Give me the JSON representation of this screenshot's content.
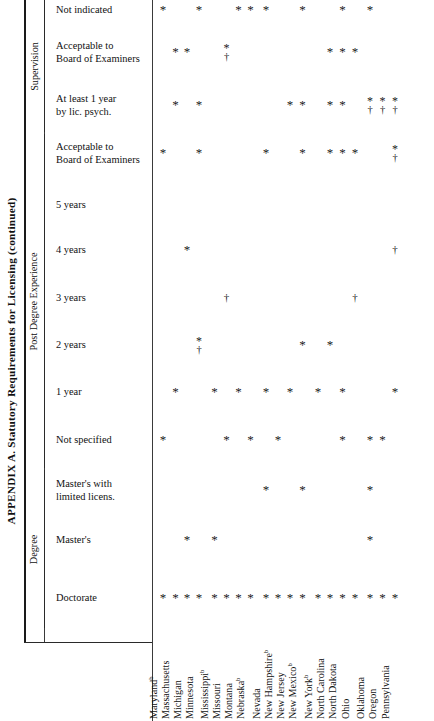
{
  "caption": "APPENDIX A.   Statutory Requirements for Licensing (continued)",
  "groups": [
    {
      "id": "supervision",
      "label": "Supervision"
    },
    {
      "id": "post-degree",
      "label": "Post Degree Experience"
    },
    {
      "id": "degree",
      "label": "Degree"
    }
  ],
  "rows": [
    {
      "id": "not-indicated",
      "group": "supervision",
      "line1": "Not indicated",
      "line2": ""
    },
    {
      "id": "sup-acceptable",
      "group": "supervision",
      "line1": "Acceptable to",
      "line2": "Board of Examiners"
    },
    {
      "id": "at-least-1-year",
      "group": "supervision",
      "line1": "At least 1 year",
      "line2": "by lic. psych."
    },
    {
      "id": "pde-acceptable",
      "group": "post-degree",
      "line1": "Acceptable to",
      "line2": "Board of Examiners"
    },
    {
      "id": "five-years",
      "group": "post-degree",
      "line1": "5 years",
      "line2": ""
    },
    {
      "id": "four-years",
      "group": "post-degree",
      "line1": "4 years",
      "line2": ""
    },
    {
      "id": "three-years",
      "group": "post-degree",
      "line1": "3 years",
      "line2": ""
    },
    {
      "id": "two-years",
      "group": "post-degree",
      "line1": "2 years",
      "line2": ""
    },
    {
      "id": "one-year",
      "group": "post-degree",
      "line1": "1 year",
      "line2": ""
    },
    {
      "id": "not-specified",
      "group": "post-degree",
      "line1": "Not specified",
      "line2": ""
    },
    {
      "id": "masters-limited",
      "group": "degree",
      "line1": "Master's with",
      "line2": "limited licens."
    },
    {
      "id": "masters",
      "group": "degree",
      "line1": "Master's",
      "line2": ""
    },
    {
      "id": "doctorate",
      "group": "degree",
      "line1": "Doctorate",
      "line2": ""
    }
  ],
  "states": [
    {
      "id": "maryland",
      "name": "Maryland",
      "note": "b"
    },
    {
      "id": "massachusetts",
      "name": "Massachusetts",
      "note": ""
    },
    {
      "id": "michigan",
      "name": "Michigan",
      "note": ""
    },
    {
      "id": "minnesota",
      "name": "Minnesota",
      "note": ""
    },
    {
      "id": "mississippi",
      "name": "Mississippi",
      "note": "b"
    },
    {
      "id": "missouri",
      "name": "Missouri",
      "note": ""
    },
    {
      "id": "montana",
      "name": "Montana",
      "note": ""
    },
    {
      "id": "nebraska",
      "name": "Nebraska",
      "note": "b"
    },
    {
      "id": "nevada",
      "name": "Nevada",
      "note": ""
    },
    {
      "id": "new-hampshire",
      "name": "New Hampshire",
      "note": "b"
    },
    {
      "id": "new-jersey",
      "name": "New Jersey",
      "note": ""
    },
    {
      "id": "new-mexico",
      "name": "New Mexico",
      "note": "b"
    },
    {
      "id": "new-york",
      "name": "New York",
      "note": "b"
    },
    {
      "id": "north-carolina",
      "name": "North Carolina",
      "note": ""
    },
    {
      "id": "north-dakota",
      "name": "North Dakota",
      "note": ""
    },
    {
      "id": "ohio",
      "name": "Ohio",
      "note": ""
    },
    {
      "id": "oklahoma",
      "name": "Oklahoma",
      "note": ""
    },
    {
      "id": "oregon",
      "name": "Oregon",
      "note": ""
    },
    {
      "id": "pennsylvania",
      "name": "Pennsylvania",
      "note": ""
    }
  ],
  "symbols": {
    "star": "*",
    "dagger": "†",
    "star_dagger": "*†"
  },
  "marks": [
    {
      "row": "not-indicated",
      "state": "maryland",
      "symbol": "star"
    },
    {
      "row": "not-indicated",
      "state": "minnesota",
      "symbol": "star"
    },
    {
      "row": "not-indicated",
      "state": "montana",
      "symbol": "star"
    },
    {
      "row": "not-indicated",
      "state": "nebraska",
      "symbol": "star"
    },
    {
      "row": "not-indicated",
      "state": "nevada",
      "symbol": "star"
    },
    {
      "row": "not-indicated",
      "state": "new-mexico",
      "symbol": "star"
    },
    {
      "row": "not-indicated",
      "state": "north-dakota",
      "symbol": "star"
    },
    {
      "row": "not-indicated",
      "state": "oklahoma",
      "symbol": "star"
    },
    {
      "row": "sup-acceptable",
      "state": "massachusetts",
      "symbol": "star"
    },
    {
      "row": "sup-acceptable",
      "state": "michigan",
      "symbol": "star"
    },
    {
      "row": "sup-acceptable",
      "state": "missouri",
      "symbol": "star_dagger"
    },
    {
      "row": "sup-acceptable",
      "state": "north-carolina",
      "symbol": "star"
    },
    {
      "row": "sup-acceptable",
      "state": "north-dakota",
      "symbol": "star"
    },
    {
      "row": "sup-acceptable",
      "state": "ohio",
      "symbol": "star"
    },
    {
      "row": "at-least-1-year",
      "state": "massachusetts",
      "symbol": "star"
    },
    {
      "row": "at-least-1-year",
      "state": "minnesota",
      "symbol": "star"
    },
    {
      "row": "at-least-1-year",
      "state": "new-jersey",
      "symbol": "star"
    },
    {
      "row": "at-least-1-year",
      "state": "new-mexico",
      "symbol": "star"
    },
    {
      "row": "at-least-1-year",
      "state": "north-carolina",
      "symbol": "star"
    },
    {
      "row": "at-least-1-year",
      "state": "north-dakota",
      "symbol": "star"
    },
    {
      "row": "at-least-1-year",
      "state": "oklahoma",
      "symbol": "star_dagger"
    },
    {
      "row": "at-least-1-year",
      "state": "oregon",
      "symbol": "star_dagger"
    },
    {
      "row": "at-least-1-year",
      "state": "pennsylvania",
      "symbol": "star_dagger"
    },
    {
      "row": "pde-acceptable",
      "state": "maryland",
      "symbol": "star"
    },
    {
      "row": "pde-acceptable",
      "state": "minnesota",
      "symbol": "star"
    },
    {
      "row": "pde-acceptable",
      "state": "nevada",
      "symbol": "star"
    },
    {
      "row": "pde-acceptable",
      "state": "new-mexico",
      "symbol": "star"
    },
    {
      "row": "pde-acceptable",
      "state": "north-carolina",
      "symbol": "star"
    },
    {
      "row": "pde-acceptable",
      "state": "north-dakota",
      "symbol": "star"
    },
    {
      "row": "pde-acceptable",
      "state": "ohio",
      "symbol": "star"
    },
    {
      "row": "pde-acceptable",
      "state": "pennsylvania",
      "symbol": "star_dagger"
    },
    {
      "row": "four-years",
      "state": "michigan",
      "symbol": "star"
    },
    {
      "row": "four-years",
      "state": "pennsylvania",
      "symbol": "dagger"
    },
    {
      "row": "three-years",
      "state": "missouri",
      "symbol": "dagger"
    },
    {
      "row": "three-years",
      "state": "ohio",
      "symbol": "dagger"
    },
    {
      "row": "two-years",
      "state": "minnesota",
      "symbol": "star_dagger"
    },
    {
      "row": "two-years",
      "state": "new-mexico",
      "symbol": "star"
    },
    {
      "row": "two-years",
      "state": "north-carolina",
      "symbol": "star"
    },
    {
      "row": "one-year",
      "state": "massachusetts",
      "symbol": "star"
    },
    {
      "row": "one-year",
      "state": "mississippi",
      "symbol": "star"
    },
    {
      "row": "one-year",
      "state": "montana",
      "symbol": "star"
    },
    {
      "row": "one-year",
      "state": "nevada",
      "symbol": "star"
    },
    {
      "row": "one-year",
      "state": "new-jersey",
      "symbol": "star"
    },
    {
      "row": "one-year",
      "state": "new-york",
      "symbol": "star"
    },
    {
      "row": "one-year",
      "state": "north-dakota",
      "symbol": "star"
    },
    {
      "row": "one-year",
      "state": "pennsylvania",
      "symbol": "star"
    },
    {
      "row": "not-specified",
      "state": "maryland",
      "symbol": "star"
    },
    {
      "row": "not-specified",
      "state": "missouri",
      "symbol": "star"
    },
    {
      "row": "not-specified",
      "state": "nebraska",
      "symbol": "star"
    },
    {
      "row": "not-specified",
      "state": "new-hampshire",
      "symbol": "star"
    },
    {
      "row": "not-specified",
      "state": "north-dakota",
      "symbol": "star"
    },
    {
      "row": "not-specified",
      "state": "oklahoma",
      "symbol": "star"
    },
    {
      "row": "not-specified",
      "state": "oregon",
      "symbol": "star"
    },
    {
      "row": "masters-limited",
      "state": "nevada",
      "symbol": "star"
    },
    {
      "row": "masters-limited",
      "state": "new-mexico",
      "symbol": "star"
    },
    {
      "row": "masters-limited",
      "state": "oklahoma",
      "symbol": "star"
    },
    {
      "row": "masters",
      "state": "michigan",
      "symbol": "star"
    },
    {
      "row": "masters",
      "state": "mississippi",
      "symbol": "star"
    },
    {
      "row": "masters",
      "state": "oklahoma",
      "symbol": "star"
    },
    {
      "row": "doctorate",
      "state": "maryland",
      "symbol": "star"
    },
    {
      "row": "doctorate",
      "state": "massachusetts",
      "symbol": "star"
    },
    {
      "row": "doctorate",
      "state": "michigan",
      "symbol": "star"
    },
    {
      "row": "doctorate",
      "state": "minnesota",
      "symbol": "star"
    },
    {
      "row": "doctorate",
      "state": "mississippi",
      "symbol": "star"
    },
    {
      "row": "doctorate",
      "state": "missouri",
      "symbol": "star"
    },
    {
      "row": "doctorate",
      "state": "montana",
      "symbol": "star"
    },
    {
      "row": "doctorate",
      "state": "nebraska",
      "symbol": "star"
    },
    {
      "row": "doctorate",
      "state": "nevada",
      "symbol": "star"
    },
    {
      "row": "doctorate",
      "state": "new-hampshire",
      "symbol": "star"
    },
    {
      "row": "doctorate",
      "state": "new-jersey",
      "symbol": "star"
    },
    {
      "row": "doctorate",
      "state": "new-mexico",
      "symbol": "star"
    },
    {
      "row": "doctorate",
      "state": "new-york",
      "symbol": "star"
    },
    {
      "row": "doctorate",
      "state": "north-carolina",
      "symbol": "star"
    },
    {
      "row": "doctorate",
      "state": "north-dakota",
      "symbol": "star"
    },
    {
      "row": "doctorate",
      "state": "ohio",
      "symbol": "star"
    },
    {
      "row": "doctorate",
      "state": "oklahoma",
      "symbol": "star"
    },
    {
      "row": "doctorate",
      "state": "oregon",
      "symbol": "star"
    },
    {
      "row": "doctorate",
      "state": "pennsylvania",
      "symbol": "star"
    }
  ],
  "layout": {
    "row_y": {
      "not-indicated": 10,
      "sup-acceptable": 52,
      "at-least-1-year": 105,
      "pde-acceptable": 153,
      "five-years": 205,
      "four-years": 250,
      "three-years": 298,
      "two-years": 345,
      "one-year": 392,
      "not-specified": 440,
      "masters-limited": 490,
      "masters": 540,
      "doctorate": 598
    },
    "state_x": {
      "maryland": 163,
      "massachusetts": 175.5,
      "michigan": 187,
      "minnesota": 199,
      "mississippi": 214.5,
      "missouri": 226.5,
      "montana": 238.5,
      "nebraska": 250.5,
      "nevada": 266,
      "new-hampshire": 278,
      "new-jersey": 290,
      "new-mexico": 302.5,
      "new-york": 318,
      "north-carolina": 330,
      "north-dakota": 342.5,
      "ohio": 355,
      "oklahoma": 370,
      "oregon": 382.5,
      "pennsylvania": 395
    },
    "group_bounds": {
      "supervision": {
        "top": 0,
        "bottom": 132,
        "center": 62
      },
      "post-degree": {
        "top": 134,
        "bottom": 468,
        "center": 300
      },
      "degree": {
        "top": 470,
        "bottom": 628,
        "center": 545
      }
    },
    "state_label_x": {
      "maryland": 159,
      "massachusetts": 171,
      "michigan": 183,
      "minnesota": 195,
      "mississippi": 210,
      "missouri": 222,
      "montana": 234,
      "nebraska": 246,
      "nevada": 262,
      "new-hampshire": 274,
      "new-jersey": 286,
      "new-mexico": 298,
      "new-york": 314,
      "north-carolina": 326,
      "north-dakota": 338,
      "ohio": 351,
      "oklahoma": 366,
      "oregon": 378,
      "pennsylvania": 391
    }
  }
}
